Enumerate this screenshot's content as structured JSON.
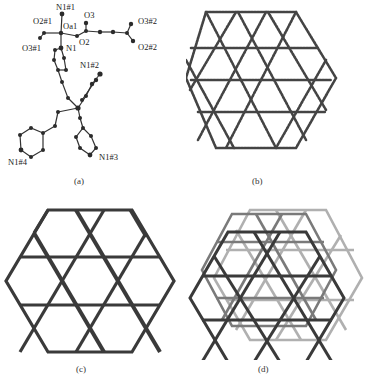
{
  "figure": {
    "panels": [
      {
        "id": "a",
        "caption": "(a)",
        "description": "Coordination environment / asymmetric unit with atom labels",
        "atom_labels": {
          "n1_1": "N1#1",
          "o2_1": "O2#1",
          "oa1": "Oa1",
          "o3": "O3",
          "o3_2": "O3#2",
          "o3_1": "O3#1",
          "n1": "N1",
          "o2": "O2",
          "o2_2": "O2#2",
          "n1_2": "N1#2",
          "n1_3": "N1#3",
          "n1_4": "N1#4"
        }
      },
      {
        "id": "b",
        "caption": "(b)",
        "description": "Packed 2D network with hexagonal and triangular windows"
      },
      {
        "id": "c",
        "caption": "(c)",
        "description": "Simplified kagome-type hexagonal net"
      },
      {
        "id": "d",
        "caption": "(d)",
        "description": "Interpenetrated / stacked kagome nets"
      }
    ],
    "colors": {
      "ink": "#2a2a2a",
      "bond_dark": "#3a3a3a",
      "bond_light": "#9a9a9a",
      "atom": "#2b2b2b"
    }
  }
}
